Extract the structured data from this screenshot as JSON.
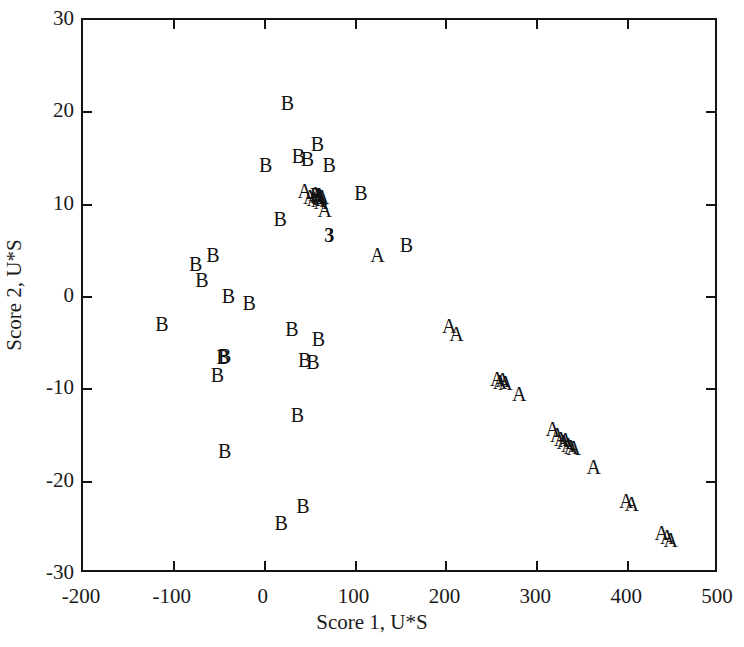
{
  "chart_data": {
    "type": "scatter",
    "title": "",
    "xlabel": "Score 1, U*S",
    "ylabel": "Score 2, U*S",
    "xlim": [
      -200,
      500
    ],
    "ylim": [
      -30,
      30
    ],
    "xticks": [
      -200,
      -100,
      0,
      100,
      200,
      300,
      400,
      500
    ],
    "yticks": [
      -30,
      -20,
      -10,
      0,
      10,
      20,
      30
    ],
    "xticklabels": [
      "-200",
      "-100",
      "0",
      "100",
      "200",
      "300",
      "400",
      "500"
    ],
    "yticklabels": [
      "-30",
      "-20",
      "-10",
      "0",
      "10",
      "20",
      "30"
    ],
    "grid": false,
    "legend": "none",
    "frame": "box-all-sides-with-inward-ticks",
    "marker_style": "text-letter",
    "series": [
      {
        "name": "A",
        "label": "A",
        "marker": "A",
        "points": [
          [
            44,
            11.5
          ],
          [
            50,
            10.8
          ],
          [
            54,
            10.6
          ],
          [
            56,
            11.2
          ],
          [
            58,
            10.9
          ],
          [
            59,
            10.5
          ],
          [
            60,
            11.0
          ],
          [
            61,
            10.7
          ],
          [
            62,
            10.3
          ],
          [
            63,
            10.8
          ],
          [
            66,
            9.4
          ],
          [
            124,
            4.5
          ],
          [
            203,
            -3.1
          ],
          [
            211,
            -4.0
          ],
          [
            256,
            -8.9
          ],
          [
            259,
            -9.2
          ],
          [
            262,
            -9.0
          ],
          [
            265,
            -9.3
          ],
          [
            280,
            -10.5
          ],
          [
            317,
            -14.3
          ],
          [
            322,
            -14.9
          ],
          [
            326,
            -15.4
          ],
          [
            329,
            -15.7
          ],
          [
            331,
            -15.5
          ],
          [
            334,
            -16.0
          ],
          [
            337,
            -16.2
          ],
          [
            340,
            -16.4
          ],
          [
            362,
            -18.4
          ],
          [
            398,
            -22.1
          ],
          [
            404,
            -22.4
          ],
          [
            437,
            -25.6
          ],
          [
            443,
            -26.0
          ],
          [
            447,
            -26.3
          ]
        ]
      },
      {
        "name": "B",
        "label": "B",
        "marker": "B",
        "points": [
          [
            25,
            21.0
          ],
          [
            58,
            16.6
          ],
          [
            37,
            15.3
          ],
          [
            47,
            15.0
          ],
          [
            71,
            14.3
          ],
          [
            1,
            14.3
          ],
          [
            106,
            11.3
          ],
          [
            57,
            11.0
          ],
          [
            17,
            8.4
          ],
          [
            156,
            5.6
          ],
          [
            -76,
            3.6
          ],
          [
            -57,
            4.5
          ],
          [
            -69,
            1.8
          ],
          [
            -40,
            0.1
          ],
          [
            -17,
            -0.6
          ],
          [
            -113,
            -2.9
          ],
          [
            30,
            -3.5
          ],
          [
            59,
            -4.5
          ],
          [
            -46,
            -6.5
          ],
          [
            -44,
            -6.4
          ],
          [
            44,
            -6.8
          ],
          [
            53,
            -7.0
          ],
          [
            -52,
            -8.5
          ],
          [
            36,
            -12.8
          ],
          [
            -44,
            -16.7
          ],
          [
            42,
            -22.6
          ],
          [
            18,
            -24.5
          ]
        ]
      }
    ],
    "annotations": [
      {
        "text": "3",
        "x": 71,
        "y": 6.7,
        "bold": true
      }
    ]
  }
}
